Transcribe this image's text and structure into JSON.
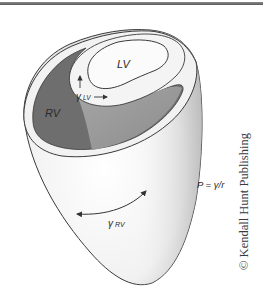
{
  "figure": {
    "labels": {
      "lv": "LV",
      "rv": "RV",
      "gamma_lv": "γ",
      "gamma_lv_sub": "LV",
      "gamma_rv": "γ",
      "gamma_rv_sub": "RV",
      "equation": "P = γ/r"
    },
    "copyright": "© Kendall Hunt Publishing",
    "colors": {
      "background": "#ffffff",
      "outline": "#3a3a3a",
      "rv_cavity": "#6e6e6e",
      "septum_shade": "#9a9a9a",
      "wall_light": "#efefef",
      "lv_cavity": "#fafafa",
      "top_bar": "#707070"
    }
  }
}
